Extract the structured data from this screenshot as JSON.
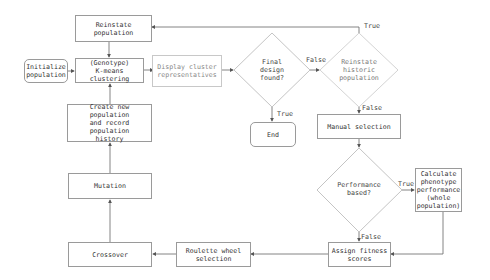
{
  "diagram": {
    "type": "flowchart",
    "nodes": {
      "reinstate_population": "Reinstate\npopulation",
      "initialize_population": "Initialize\npopulation",
      "kmeans": "(Genotype)\nK-means\nclustering",
      "display_cluster": "Display cluster\nrepresentatives",
      "final_design": "Final\ndesign\nfound?",
      "reinstate_historic": "Reinstate\nhistoric\npopulation",
      "end": "End",
      "manual_selection": "Manual selection",
      "performance_based": "Performance\nbased?",
      "calculate_performance": "Calculate\nphenotype\nperformance\n(whole\npopulation)",
      "assign_fitness": "Assign fitness\nscores",
      "roulette": "Roulette wheel\nselection",
      "crossover": "Crossover",
      "mutation": "Mutation",
      "create_new_population": "Create new population\nand record population\nhistory"
    },
    "edge_labels": {
      "final_false": "False",
      "final_true": "True",
      "historic_true": "True",
      "historic_false": "False",
      "perf_true": "True",
      "perf_false": "False"
    },
    "colors": {
      "line": "#666666",
      "border": "#9a9a9a",
      "faded_border": "#c8c8c8"
    }
  }
}
